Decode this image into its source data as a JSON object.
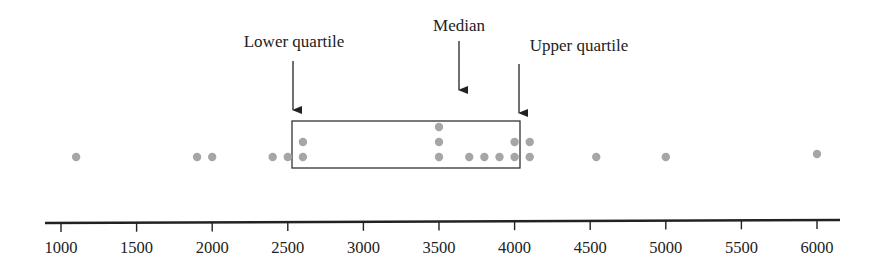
{
  "chart_data": {
    "type": "scatter",
    "subtype": "dot plot with quartile box",
    "title": "",
    "xlabel": "",
    "ylabel": "",
    "xlim": [
      1000,
      6000
    ],
    "x_ticks": [
      1000,
      1500,
      2000,
      2500,
      3000,
      3500,
      4000,
      4500,
      5000,
      5500,
      6000
    ],
    "x_tick_labels": [
      "1000",
      "1500",
      "2000",
      "2500",
      "3000",
      "3500",
      "4000",
      "4500",
      "5000",
      "5500",
      "6000"
    ],
    "grid": false,
    "legend": null,
    "values": [
      1100,
      1900,
      2000,
      2400,
      2500,
      2600,
      2600,
      3500,
      3500,
      3500,
      3700,
      3800,
      3900,
      4000,
      4000,
      4100,
      4100,
      4540,
      5000,
      6000
    ],
    "dot_stacks": [
      {
        "x": 1100,
        "count": 1
      },
      {
        "x": 1900,
        "count": 1
      },
      {
        "x": 2000,
        "count": 1
      },
      {
        "x": 2400,
        "count": 1
      },
      {
        "x": 2500,
        "count": 1
      },
      {
        "x": 2600,
        "count": 2
      },
      {
        "x": 3500,
        "count": 3
      },
      {
        "x": 3700,
        "count": 1
      },
      {
        "x": 3800,
        "count": 1
      },
      {
        "x": 3900,
        "count": 1
      },
      {
        "x": 4000,
        "count": 2
      },
      {
        "x": 4100,
        "count": 2
      },
      {
        "x": 4540,
        "count": 1
      },
      {
        "x": 5000,
        "count": 1
      },
      {
        "x": 6000,
        "count": 1
      }
    ],
    "box": {
      "lower_quartile": 2550,
      "upper_quartile": 4050,
      "median": 3650
    },
    "annotations": [
      {
        "text": "Lower quartile",
        "x": 2550
      },
      {
        "text": "Median",
        "x": 3650
      },
      {
        "text": "Upper quartile",
        "x": 4050
      }
    ]
  },
  "colors": {
    "dot": "#a6a6a6",
    "line": "#222222",
    "text": "#222222"
  }
}
